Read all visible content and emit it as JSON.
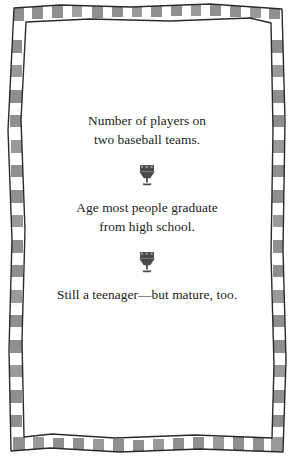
{
  "page": {
    "background_color": "#ffffff",
    "ink_color": "#1b1b1b",
    "border": {
      "name": "checkered-hand-drawn-frame",
      "square_color": "#8f8f8f",
      "line_color": "#2b2b2b",
      "square_count_top": 14,
      "square_count_bottom": 14,
      "square_count_side": 17
    }
  },
  "ornament": {
    "name": "goblet-ornament",
    "color": "#4a4a4a",
    "glyph": "goblet"
  },
  "clues": [
    {
      "index": 1,
      "lines": [
        "Number of players on",
        "two baseball teams."
      ]
    },
    {
      "index": 2,
      "lines": [
        "Age most people graduate",
        "from high school."
      ]
    },
    {
      "index": 3,
      "lines": [
        "Still a teenager—but mature, too."
      ]
    }
  ]
}
